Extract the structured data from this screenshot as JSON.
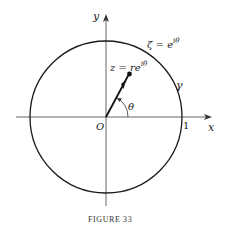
{
  "figure": {
    "caption": "FIGURE 33",
    "labels": {
      "y_axis": "y",
      "x_axis": "x",
      "origin": "O",
      "one": "1",
      "zeta_lhs": "ζ = e",
      "zeta_sup": "iθ",
      "z_lhs": "z = re",
      "z_sup": "iθ",
      "gamma": "γ",
      "theta": "θ"
    },
    "colors": {
      "ink": "#1a1a1a",
      "axis": "#555555",
      "background": "#ffffff"
    },
    "geometry": {
      "origin": [
        106,
        117
      ],
      "circle_radius": 76,
      "point_z": [
        129,
        74
      ]
    }
  }
}
